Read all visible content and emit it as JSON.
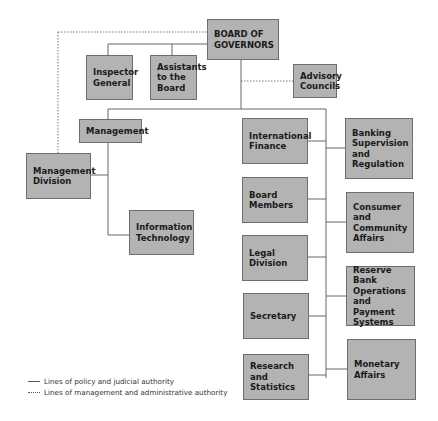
{
  "chart": {
    "type": "org-chart",
    "nodes": {
      "board": "BOARD OF GOVERNORS",
      "inspector": "Inspector General",
      "assistants": "Assistants to the Board",
      "advisory": "Advisory Councils",
      "management": "Management",
      "mgmt_division": "Management Division",
      "info_tech": "Information Technology",
      "intl_finance": "International Finance",
      "board_members": "Board Members",
      "legal": "Legal Division",
      "secretary": "Secretary",
      "research": "Research and Statistics",
      "banking": "Banking Supervision and Regulation",
      "consumer": "Consumer and Community Affairs",
      "reserve_bank": "Reserve Bank Operations and Payment Systems",
      "monetary": "Monetary Affairs"
    },
    "legend": {
      "solid": "Lines of policy and judicial authority",
      "dotted": "Lines of management and administrative authority"
    },
    "colors": {
      "box_fill": "#b3b3b3",
      "box_border": "#6e6e6e",
      "line": "#666666"
    }
  }
}
